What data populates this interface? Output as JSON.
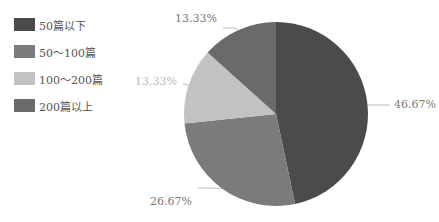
{
  "chart_data": {
    "type": "pie",
    "title": "",
    "categories": [
      "50篇以下",
      "50～100篇",
      "100～200篇",
      "200篇以上"
    ],
    "values": [
      46.67,
      26.67,
      13.33,
      13.33
    ],
    "labels": [
      "46.67%",
      "26.67%",
      "13.33%",
      "13.33%"
    ],
    "colors": [
      "#4b4b4b",
      "#7b7b7b",
      "#c2c2c2",
      "#6a6a6a"
    ],
    "legend_position": "left",
    "start_angle_deg": 0,
    "direction": "clockwise"
  },
  "legend": {
    "items": [
      {
        "label": "50篇以下",
        "color": "#4b4b4b"
      },
      {
        "label": "50～100篇",
        "color": "#7b7b7b"
      },
      {
        "label": "100～200篇",
        "color": "#c2c2c2"
      },
      {
        "label": "200篇以上",
        "color": "#6a6a6a"
      }
    ]
  },
  "caption": "图 1  …"
}
